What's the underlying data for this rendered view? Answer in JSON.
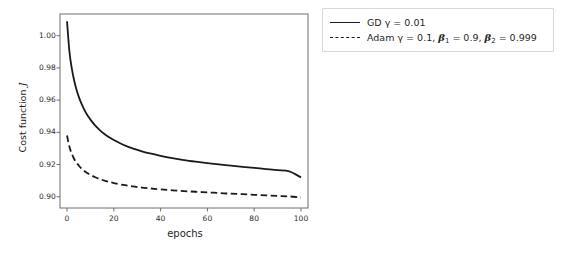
{
  "chart_data": {
    "type": "line",
    "title": "",
    "xlabel": "epochs",
    "ylabel_text": "Cost function",
    "ylabel_symbol": "J",
    "xlim": [
      -3,
      103
    ],
    "ylim": [
      0.893,
      1.0135
    ],
    "xticks": [
      0,
      20,
      40,
      60,
      80,
      100
    ],
    "xticklabels": [
      "0",
      "20",
      "40",
      "60",
      "80",
      "100"
    ],
    "yticks": [
      0.9,
      0.92,
      0.94,
      0.96,
      0.98,
      1.0
    ],
    "yticklabels": [
      "0.90",
      "0.92",
      "0.94",
      "0.96",
      "0.98",
      "1.00"
    ],
    "grid": false,
    "legend_position": "outside-right-top",
    "axes_color": "#6e6e6e",
    "line_color": "#1a1a1a",
    "series": [
      {
        "name": "GD",
        "legend_label_parts": {
          "prefix": "GD ",
          "gamma": "γ",
          "value": " = 0.01"
        },
        "style": "solid",
        "color": "#1a1a1a",
        "x": [
          0,
          1,
          2,
          3,
          4,
          5,
          6,
          7,
          8,
          9,
          10,
          12,
          14,
          16,
          18,
          20,
          24,
          28,
          32,
          36,
          40,
          45,
          50,
          55,
          60,
          65,
          70,
          75,
          80,
          85,
          90,
          95,
          100
        ],
        "y": [
          1.009,
          0.9905,
          0.98,
          0.9725,
          0.9668,
          0.9622,
          0.9584,
          0.9552,
          0.9524,
          0.95,
          0.9479,
          0.9443,
          0.9414,
          0.939,
          0.937,
          0.9352,
          0.9323,
          0.93,
          0.9282,
          0.9267,
          0.9254,
          0.924,
          0.9228,
          0.9218,
          0.9209,
          0.9201,
          0.9193,
          0.9186,
          0.9179,
          0.9172,
          0.9165,
          0.9158,
          0.912
        ]
      },
      {
        "name": "Adam",
        "legend_label_parts": {
          "prefix": "Adam ",
          "gamma": "γ",
          "value": " = 0.1, ",
          "beta": "β",
          "beta1_sub": "1",
          "beta1_value": " = 0.9, ",
          "beta2_sub": "2",
          "beta2_value": " = 0.999"
        },
        "style": "dashed",
        "color": "#1a1a1a",
        "x": [
          0,
          1,
          2,
          3,
          4,
          5,
          6,
          7,
          8,
          9,
          10,
          12,
          14,
          16,
          18,
          20,
          24,
          28,
          32,
          36,
          40,
          45,
          50,
          55,
          60,
          65,
          70,
          75,
          80,
          85,
          90,
          95,
          100
        ],
        "y": [
          0.938,
          0.9312,
          0.9268,
          0.9236,
          0.9212,
          0.9194,
          0.9178,
          0.9165,
          0.9154,
          0.9144,
          0.9136,
          0.9121,
          0.911,
          0.91,
          0.9092,
          0.9085,
          0.9073,
          0.9064,
          0.9057,
          0.9051,
          0.9046,
          0.904,
          0.9035,
          0.9031,
          0.9027,
          0.9023,
          0.9019,
          0.9016,
          0.9012,
          0.9009,
          0.9005,
          0.9002,
          0.8995
        ]
      }
    ]
  }
}
